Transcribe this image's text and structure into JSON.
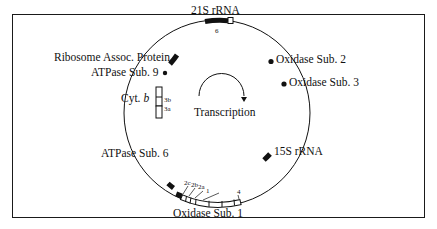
{
  "diagram": {
    "type": "circular genome map",
    "center_label": "Transcription",
    "genes": [
      {
        "id": "21s-rrna",
        "label": "21S rRNA",
        "sub_label": "6"
      },
      {
        "id": "oxidase-sub-2",
        "label": "Oxidase Sub. 2"
      },
      {
        "id": "oxidase-sub-3",
        "label": "Oxidase Sub. 3"
      },
      {
        "id": "15s-rrna",
        "label": "15S rRNA"
      },
      {
        "id": "oxidase-sub-1",
        "label": "Oxidase Sub. 1",
        "exon_labels": [
          "2c",
          "2b",
          "2a",
          "1",
          "4"
        ]
      },
      {
        "id": "atpase-sub-6",
        "label": "ATPase Sub. 6"
      },
      {
        "id": "cyt-b",
        "label_prefix": "Cyt.",
        "label_italic": "b",
        "exon_labels": [
          "3b",
          "3a"
        ]
      },
      {
        "id": "atpase-sub-9",
        "label": "ATPase Sub. 9"
      },
      {
        "id": "ribosome-assoc-protein",
        "label": "Ribosome Assoc. Protein"
      }
    ]
  }
}
